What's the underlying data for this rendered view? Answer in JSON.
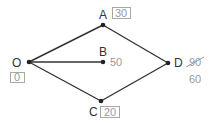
{
  "diagram": {
    "type": "shortest-path-graph",
    "colors": {
      "edge": "#333333",
      "node": "#222222",
      "label": "#333333",
      "value": "#9a9a9a",
      "box": "#a8a8a8"
    },
    "nodes": {
      "O": {
        "label": "O",
        "value": "0",
        "boxed": true
      },
      "A": {
        "label": "A",
        "value": "30",
        "boxed": true
      },
      "B": {
        "label": "B",
        "value": "50",
        "boxed": false
      },
      "C": {
        "label": "C",
        "value": "20",
        "boxed": true
      },
      "D": {
        "label": "D",
        "old_value": "90",
        "value": "60",
        "boxed": false,
        "old_value_struck": true
      }
    },
    "edges": [
      {
        "from": "O",
        "to": "A"
      },
      {
        "from": "O",
        "to": "B"
      },
      {
        "from": "O",
        "to": "C"
      },
      {
        "from": "A",
        "to": "D"
      },
      {
        "from": "C",
        "to": "D"
      }
    ]
  }
}
